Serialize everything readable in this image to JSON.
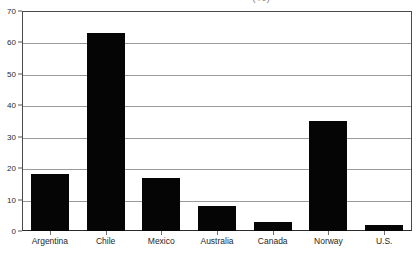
{
  "chart_data": {
    "type": "bar",
    "title": "",
    "title_clipped_remnant": "(%)",
    "xlabel": "",
    "ylabel": "",
    "categories": [
      "Argentina",
      "Chile",
      "Mexico",
      "Australia",
      "Canada",
      "Norway",
      "U.S."
    ],
    "values": [
      18,
      63,
      17,
      8,
      3,
      35,
      2
    ],
    "ylim": [
      0,
      70
    ],
    "yticks": [
      0,
      10,
      20,
      30,
      40,
      50,
      60,
      70
    ],
    "ytick_labels": [
      "0",
      "10",
      "20",
      "30",
      "40",
      "50",
      "60",
      "70"
    ],
    "grid": true,
    "grid_axis": "y",
    "legend": false,
    "legend_position": "none",
    "bar_color": "#050505",
    "gridline_color": "#9a9a9a",
    "axis_color": "#4a4a4a",
    "background_color": "#ffffff"
  }
}
